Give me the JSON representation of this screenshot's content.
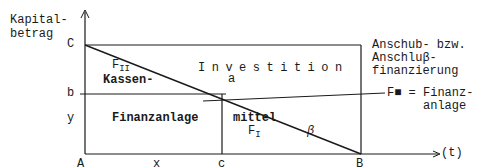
{
  "diagram": {
    "axis_y_label_line1": "Kapital-",
    "axis_y_label_line2": "betrag",
    "axis_x_label": "(t)",
    "points": {
      "C": "C",
      "b": "b",
      "y": "y",
      "A": "A",
      "x": "x",
      "c": "c",
      "B": "B",
      "a": "a"
    },
    "regions": {
      "f2": "F",
      "f2_sub": "II",
      "kassen": "Kassen-",
      "investition": "Investition",
      "finanzanlage": "Finanzanlage",
      "mittel": "mittel",
      "f1": "F",
      "f1_sub": "I",
      "beta": "β"
    },
    "annotations": {
      "anschub_line1": "Anschub- bzw.",
      "anschub_line2": "Anschluβ-",
      "anschub_line3": "finanzierung",
      "fm_line1": "F■ = Finanz-",
      "fm_line2": "anlage"
    },
    "line_color": "#1a1a1a"
  }
}
